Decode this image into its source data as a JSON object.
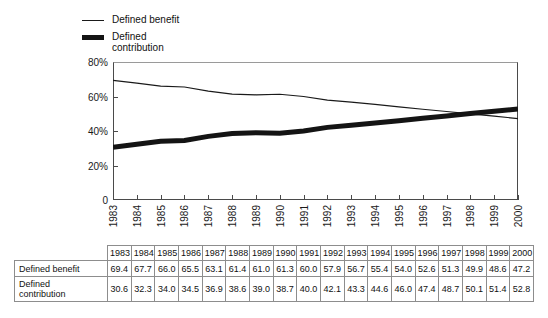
{
  "legend": {
    "items": [
      {
        "label": "Defined benefit",
        "marker": "thin-line",
        "color": "#1a1a1a"
      },
      {
        "label": "Defined\ncontribution",
        "marker": "thick-line",
        "color": "#141414"
      }
    ]
  },
  "chart_data": {
    "type": "line",
    "title": "",
    "xlabel": "",
    "ylabel": "",
    "ylim": [
      0,
      80
    ],
    "yticks": [
      0,
      20,
      40,
      60,
      80
    ],
    "ytick_labels": [
      "0",
      "20%",
      "40%",
      "60%",
      "80%"
    ],
    "grid": false,
    "legend_position": "top-left",
    "categories": [
      "1983",
      "1984",
      "1985",
      "1986",
      "1987",
      "1988",
      "1989",
      "1990",
      "1991",
      "1992",
      "1993",
      "1994",
      "1995",
      "1996",
      "1997",
      "1998",
      "1999",
      "2000"
    ],
    "series": [
      {
        "name": "Defined benefit",
        "style": "thin",
        "values": [
          69.4,
          67.7,
          66.0,
          65.5,
          63.1,
          61.4,
          61.0,
          61.3,
          60.0,
          57.9,
          56.7,
          55.4,
          54.0,
          52.6,
          51.3,
          49.9,
          48.6,
          47.2
        ]
      },
      {
        "name": "Defined contribution",
        "style": "thick",
        "values": [
          30.6,
          32.3,
          34.0,
          34.5,
          36.9,
          38.6,
          39.0,
          38.7,
          40.0,
          42.1,
          43.3,
          44.6,
          46.0,
          47.4,
          48.7,
          50.1,
          51.4,
          52.8
        ]
      }
    ]
  },
  "table": {
    "corner_label": "",
    "columns": [
      "1983",
      "1984",
      "1985",
      "1986",
      "1987",
      "1988",
      "1989",
      "1990",
      "1991",
      "1992",
      "1993",
      "1994",
      "1995",
      "1996",
      "1997",
      "1998",
      "1999",
      "2000"
    ],
    "rows": [
      {
        "label": "Defined benefit",
        "values": [
          "69.4",
          "67.7",
          "66.0",
          "65.5",
          "63.1",
          "61.4",
          "61.0",
          "61.3",
          "60.0",
          "57.9",
          "56.7",
          "55.4",
          "54.0",
          "52.6",
          "51.3",
          "49.9",
          "48.6",
          "47.2"
        ]
      },
      {
        "label": "Defined\ncontribution",
        "values": [
          "30.6",
          "32.3",
          "34.0",
          "34.5",
          "36.9",
          "38.6",
          "39.0",
          "38.7",
          "40.0",
          "42.1",
          "43.3",
          "44.6",
          "46.0",
          "47.4",
          "48.7",
          "50.1",
          "51.4",
          "52.8"
        ]
      }
    ]
  }
}
